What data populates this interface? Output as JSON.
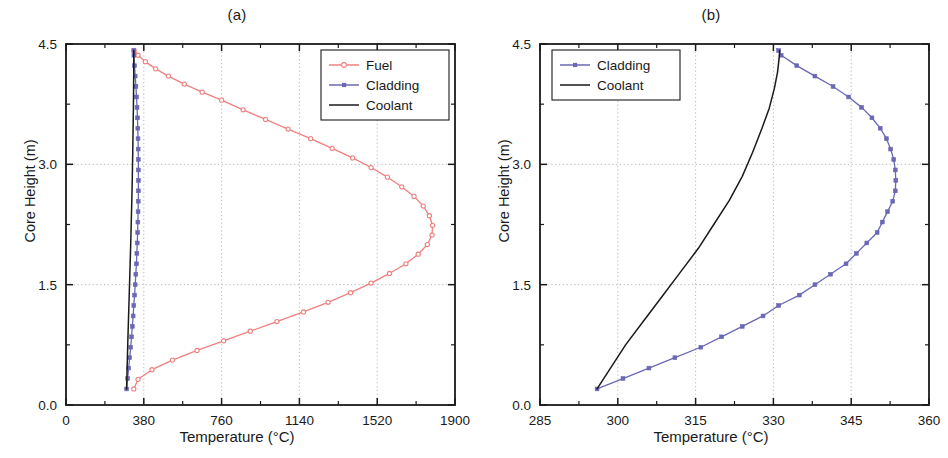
{
  "figure": {
    "background": "#ffffff",
    "panels": [
      {
        "label": "(a)",
        "name": "panel-a"
      },
      {
        "label": "(b)",
        "name": "panel-b"
      }
    ]
  },
  "colors": {
    "fuel": "#f08080",
    "cladding": "#6a68b4",
    "coolant": "#1a1a1a",
    "axis": "#1a1a1a",
    "grid": "#b0b0b0"
  },
  "chart_data": [
    {
      "type": "line",
      "name": "panel-a",
      "title": "(a)",
      "xlabel": "Temperature (°C)",
      "ylabel": "Core Height (m)",
      "xlim": [
        0,
        1900
      ],
      "ylim": [
        0.0,
        4.5
      ],
      "xticks": [
        0,
        380,
        760,
        1140,
        1520,
        1900
      ],
      "xticklabels": [
        "0",
        "380",
        "760",
        "1140",
        "1520",
        "1900"
      ],
      "yticks": [
        0.0,
        1.5,
        3.0,
        4.5
      ],
      "yticklabels": [
        "0.0",
        "1.5",
        "3.0",
        "4.5"
      ],
      "xminorticks": [
        190,
        570,
        950,
        1330,
        1710
      ],
      "yminorticks": [
        0.75,
        2.25,
        3.75
      ],
      "grid": true,
      "grid_style": "dotted",
      "legend": [
        "Fuel",
        "Cladding",
        "Coolant"
      ],
      "legend_position": "upper right",
      "series": [
        {
          "name": "Fuel",
          "color": "#f08080",
          "marker": "open-circle",
          "x": [
            331,
            352,
            420,
            520,
            640,
            770,
            900,
            1030,
            1160,
            1280,
            1390,
            1490,
            1580,
            1660,
            1720,
            1765,
            1788,
            1790,
            1775,
            1745,
            1700,
            1640,
            1570,
            1490,
            1400,
            1300,
            1195,
            1085,
            975,
            865,
            760,
            665,
            578,
            500,
            438,
            388,
            352,
            333
          ],
          "y": [
            0.2,
            0.32,
            0.44,
            0.56,
            0.68,
            0.8,
            0.92,
            1.04,
            1.16,
            1.28,
            1.4,
            1.52,
            1.64,
            1.76,
            1.88,
            2.0,
            2.12,
            2.24,
            2.36,
            2.48,
            2.6,
            2.72,
            2.84,
            2.96,
            3.08,
            3.2,
            3.32,
            3.44,
            3.56,
            3.68,
            3.8,
            3.9,
            4.0,
            4.1,
            4.19,
            4.28,
            4.36,
            4.42
          ]
        },
        {
          "name": "Cladding",
          "color": "#6a68b4",
          "marker": "filled-square",
          "x": [
            296,
            301,
            306,
            311,
            316,
            320,
            324,
            328,
            331,
            335,
            338,
            341,
            344,
            346,
            348,
            350,
            351,
            352,
            353,
            353.5,
            353.6,
            353.5,
            353.2,
            352.6,
            351.8,
            350.6,
            349.0,
            347.0,
            344.5,
            341.5,
            338.0,
            334.5,
            331.5,
            331.0
          ],
          "y": [
            0.2,
            0.33,
            0.46,
            0.59,
            0.72,
            0.85,
            0.98,
            1.11,
            1.24,
            1.37,
            1.5,
            1.63,
            1.76,
            1.89,
            2.02,
            2.15,
            2.28,
            2.41,
            2.54,
            2.67,
            2.8,
            2.93,
            3.06,
            3.19,
            3.32,
            3.45,
            3.58,
            3.71,
            3.84,
            3.97,
            4.1,
            4.23,
            4.36,
            4.42
          ]
        },
        {
          "name": "Coolant",
          "color": "#1a1a1a",
          "marker": "none",
          "x": [
            296,
            298.5,
            301.5,
            305,
            308.5,
            312,
            315.5,
            318.5,
            321.5,
            324,
            326,
            327.8,
            329.2,
            330.2,
            330.8,
            331.1,
            331.2
          ],
          "y": [
            0.2,
            0.45,
            0.75,
            1.05,
            1.35,
            1.65,
            1.95,
            2.25,
            2.55,
            2.85,
            3.15,
            3.45,
            3.7,
            3.95,
            4.15,
            4.32,
            4.42
          ]
        }
      ]
    },
    {
      "type": "line",
      "name": "panel-b",
      "title": "(b)",
      "xlabel": "Temperature (°C)",
      "ylabel": "Core Height (m)",
      "xlim": [
        285,
        360
      ],
      "ylim": [
        0.0,
        4.5
      ],
      "xticks": [
        285,
        300,
        315,
        330,
        345,
        360
      ],
      "xticklabels": [
        "285",
        "300",
        "315",
        "330",
        "345",
        "360"
      ],
      "yticks": [
        0.0,
        1.5,
        3.0,
        4.5
      ],
      "yticklabels": [
        "0.0",
        "1.5",
        "3.0",
        "4.5"
      ],
      "xminorticks": [
        292.5,
        307.5,
        322.5,
        337.5,
        352.5
      ],
      "yminorticks": [
        0.75,
        2.25,
        3.75
      ],
      "grid": true,
      "grid_style": "dotted",
      "legend": [
        "Cladding",
        "Coolant"
      ],
      "legend_position": "upper left",
      "series": [
        {
          "name": "Cladding",
          "color": "#6a68b4",
          "marker": "filled-square",
          "x": [
            296,
            301,
            306,
            311,
            316,
            320,
            324,
            328,
            331,
            335,
            338,
            341,
            344,
            346,
            348,
            350,
            351,
            352,
            353,
            353.5,
            353.6,
            353.5,
            353.2,
            352.6,
            351.8,
            350.6,
            349.0,
            347.0,
            344.5,
            341.5,
            338.0,
            334.5,
            331.5,
            331.0
          ],
          "y": [
            0.2,
            0.33,
            0.46,
            0.59,
            0.72,
            0.85,
            0.98,
            1.11,
            1.24,
            1.37,
            1.5,
            1.63,
            1.76,
            1.89,
            2.02,
            2.15,
            2.28,
            2.41,
            2.54,
            2.67,
            2.8,
            2.93,
            3.06,
            3.19,
            3.32,
            3.45,
            3.58,
            3.71,
            3.84,
            3.97,
            4.1,
            4.23,
            4.36,
            4.42
          ]
        },
        {
          "name": "Coolant",
          "color": "#1a1a1a",
          "marker": "none",
          "x": [
            296,
            298.5,
            301.5,
            305,
            308.5,
            312,
            315.5,
            318.5,
            321.5,
            324,
            326,
            327.8,
            329.2,
            330.2,
            330.8,
            331.1,
            331.2
          ],
          "y": [
            0.2,
            0.45,
            0.75,
            1.05,
            1.35,
            1.65,
            1.95,
            2.25,
            2.55,
            2.85,
            3.15,
            3.45,
            3.7,
            3.95,
            4.15,
            4.32,
            4.42
          ]
        }
      ]
    }
  ]
}
